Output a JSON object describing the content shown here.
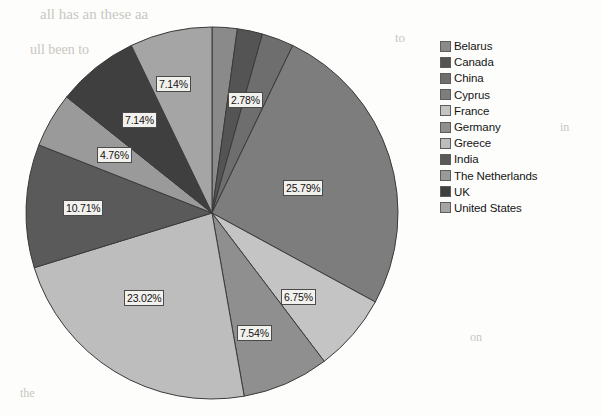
{
  "figure": {
    "kind": "pie-chart",
    "grayscale": true,
    "center_x": 212,
    "center_y": 213,
    "radius": 186
  },
  "legend": {
    "position": "right",
    "items": [
      {
        "label": "Belarus",
        "color": "#8a8a8a"
      },
      {
        "label": "Canada",
        "color": "#545454"
      },
      {
        "label": "China",
        "color": "#6e6e6e"
      },
      {
        "label": "Cyprus",
        "color": "#7d7d7d"
      },
      {
        "label": "France",
        "color": "#c4c4c4"
      },
      {
        "label": "Germany",
        "color": "#8f8f8f"
      },
      {
        "label": "Greece",
        "color": "#bdbdbd"
      },
      {
        "label": "India",
        "color": "#5a5a5a"
      },
      {
        "label": "The Netherlands",
        "color": "#9a9a9a"
      },
      {
        "label": "UK",
        "color": "#3f3f3f"
      },
      {
        "label": "United States",
        "color": "#a5a5a5"
      }
    ]
  },
  "chart_data": {
    "type": "pie",
    "title": "",
    "units": "percent",
    "label_format": "0.00%",
    "start_angle_deg": -90,
    "direction": "clockwise",
    "categories": [
      "Belarus",
      "Canada",
      "China",
      "Cyprus",
      "France",
      "Germany",
      "Greece",
      "India",
      "The Netherlands",
      "UK",
      "United States"
    ],
    "values": [
      2.18,
      2.19,
      2.78,
      25.79,
      6.75,
      7.54,
      23.02,
      10.71,
      4.76,
      7.14,
      7.14
    ],
    "labels": [
      "",
      "",
      "2.78%",
      "25.79%",
      "6.75%",
      "7.54%",
      "23.02%",
      "10.71%",
      "4.76%",
      "7.14%",
      "7.14%"
    ],
    "colors": [
      "#8a8a8a",
      "#545454",
      "#6e6e6e",
      "#7d7d7d",
      "#c4c4c4",
      "#8f8f8f",
      "#bdbdbd",
      "#5a5a5a",
      "#9a9a9a",
      "#3f3f3f",
      "#a5a5a5"
    ],
    "visible_labels": [
      "2.78%",
      "25.79%",
      "6.75%",
      "7.54%",
      "23.02%",
      "10.71%",
      "4.76%",
      "7.14%",
      "7.14%"
    ],
    "legend_position": "right",
    "grid": false
  },
  "slice_labels": [
    {
      "text": "7.14%",
      "x": 156,
      "y": 76,
      "name": "slice-label-united-states"
    },
    {
      "text": "2.78%",
      "x": 228,
      "y": 92,
      "name": "slice-label-china"
    },
    {
      "text": "25.79%",
      "x": 283,
      "y": 180,
      "name": "slice-label-cyprus"
    },
    {
      "text": "6.75%",
      "x": 281,
      "y": 289,
      "name": "slice-label-france"
    },
    {
      "text": "7.54%",
      "x": 237,
      "y": 325,
      "name": "slice-label-germany"
    },
    {
      "text": "23.02%",
      "x": 124,
      "y": 290,
      "name": "slice-label-greece"
    },
    {
      "text": "10.71%",
      "x": 63,
      "y": 200,
      "name": "slice-label-india"
    },
    {
      "text": "4.76%",
      "x": 97,
      "y": 147,
      "name": "slice-label-netherlands"
    },
    {
      "text": "7.14%",
      "x": 122,
      "y": 112,
      "name": "slice-label-uk"
    }
  ],
  "background_bleed": [
    {
      "text": "all has an these aa",
      "x": 40,
      "y": 6,
      "size": 15
    },
    {
      "text": "ull been to",
      "x": 30,
      "y": 42,
      "size": 14
    },
    {
      "text": "to",
      "x": 395,
      "y": 30,
      "size": 13
    },
    {
      "text": "in",
      "x": 560,
      "y": 120,
      "size": 12
    },
    {
      "text": "the",
      "x": 20,
      "y": 386,
      "size": 12
    },
    {
      "text": "on",
      "x": 470,
      "y": 330,
      "size": 12
    }
  ]
}
